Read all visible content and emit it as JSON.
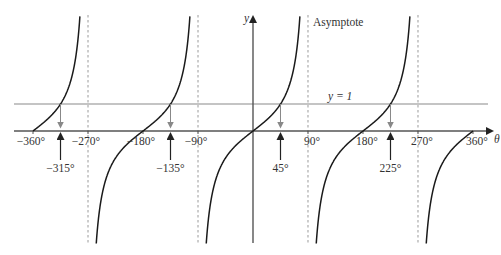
{
  "chart_data": {
    "type": "line",
    "title": "",
    "function": "y = tan θ",
    "xlabel": "θ",
    "ylabel": "y",
    "xlim": [
      -380,
      380
    ],
    "x_ticks": [
      -360,
      -270,
      -180,
      -90,
      90,
      180,
      270,
      360
    ],
    "x_tick_labels": [
      "−360°",
      "−270°",
      "−180°",
      "−90°",
      "90°",
      "180°",
      "270°",
      "360°"
    ],
    "asymptotes": [
      -270,
      -90,
      90,
      270
    ],
    "asymptote_label": "Asymptote",
    "horizontal_line": {
      "y": 1,
      "label": "y = 1"
    },
    "solutions": [
      {
        "theta": -315,
        "label": "−315°"
      },
      {
        "theta": -135,
        "label": "−135°"
      },
      {
        "theta": 45,
        "label": "45°"
      },
      {
        "theta": 225,
        "label": "225°"
      }
    ],
    "branches": [
      {
        "from": -360,
        "to": -270
      },
      {
        "from": -270,
        "to": -90
      },
      {
        "from": -90,
        "to": 90
      },
      {
        "from": 90,
        "to": 270
      },
      {
        "from": 270,
        "to": 360
      }
    ],
    "grid": false,
    "legend": null
  },
  "layout": {
    "origin_x": 253,
    "origin_y": 131,
    "px_per_degree": 0.6111,
    "px_per_unit_y": 27,
    "top_y": 15,
    "bottom_y": 244,
    "colors": {
      "curve": "#1a1a1a",
      "axis": "#555555",
      "line_y1": "#8a8a8a",
      "asymptote": "#9a9a9a",
      "arrow": "#222222",
      "down_arrow": "#888888",
      "text": "#333333"
    }
  }
}
